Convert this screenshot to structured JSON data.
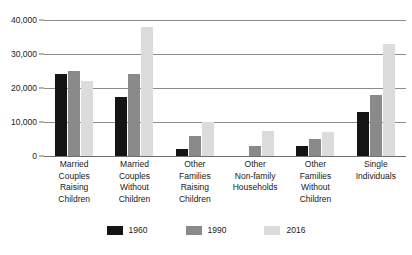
{
  "chart_data": {
    "type": "bar",
    "title": "",
    "subtitle": "",
    "xlabel": "",
    "ylabel": "",
    "ylim": [
      0,
      40000
    ],
    "ytick_labels": [
      "40,000",
      "30,000",
      "20,000",
      "10,000",
      "0"
    ],
    "ytick_values": [
      40000,
      30000,
      20000,
      10000,
      0
    ],
    "grid": true,
    "legend_position": "bottom",
    "categories": [
      "Married Couples Raising Children",
      "Married Couples Without Children",
      "Other Families Raising Children",
      "Other Non-family Households",
      "Other Families Without Children",
      "Single Individuals"
    ],
    "category_lines": [
      [
        "Married",
        "Couples",
        "Raising",
        "Children"
      ],
      [
        "Married",
        "Couples",
        "Without",
        "Children"
      ],
      [
        "Other",
        "Families",
        "Raising",
        "Children"
      ],
      [
        "Other",
        "Non-family",
        "Households"
      ],
      [
        "Other",
        "Families",
        "Without",
        "Children"
      ],
      [
        "Single",
        "Individuals"
      ]
    ],
    "series": [
      {
        "name": "1960",
        "color": "#141414",
        "values": [
          24000,
          17500,
          2000,
          0,
          3000,
          13000
        ]
      },
      {
        "name": "1990",
        "color": "#8a8a8a",
        "values": [
          25000,
          24000,
          6000,
          3000,
          5000,
          18000
        ]
      },
      {
        "name": "2016",
        "color": "#dcdcdc",
        "values": [
          22000,
          38000,
          10000,
          7500,
          7000,
          33000
        ]
      }
    ]
  },
  "legend": {
    "items": [
      {
        "label": "1960",
        "color": "#141414"
      },
      {
        "label": "1990",
        "color": "#8a8a8a"
      },
      {
        "label": "2016",
        "color": "#dcdcdc"
      }
    ]
  }
}
